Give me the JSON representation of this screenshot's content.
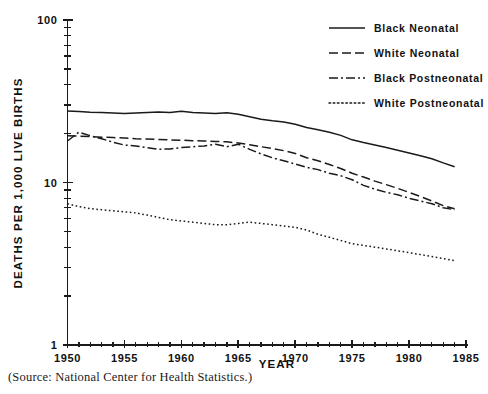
{
  "chart_data": {
    "type": "line",
    "title": "",
    "xlabel": "YEAR",
    "ylabel": "DEATHS PER 1,000 LIVE BIRTHS",
    "yscale": "log",
    "ylim": [
      1,
      100
    ],
    "xlim": [
      1949,
      1985
    ],
    "grid": false,
    "legend_position": "top-right",
    "ytick_labels": [
      "100",
      "10",
      "1"
    ],
    "ytick_values": [
      100,
      10,
      1
    ],
    "xtick_labels": [
      "1950",
      "1955",
      "1960",
      "1965",
      "1970",
      "1975",
      "1980",
      "1985"
    ],
    "xtick_values": [
      1950,
      1955,
      1960,
      1965,
      1970,
      1975,
      1980,
      1985
    ],
    "x": [
      1950,
      1951,
      1952,
      1953,
      1954,
      1955,
      1956,
      1957,
      1958,
      1959,
      1960,
      1961,
      1962,
      1963,
      1964,
      1965,
      1966,
      1967,
      1968,
      1969,
      1970,
      1971,
      1972,
      1973,
      1974,
      1975,
      1976,
      1977,
      1978,
      1979,
      1980,
      1981,
      1982,
      1983,
      1984
    ],
    "series": [
      {
        "name": "Black Neonatal",
        "style": "solid",
        "values": [
          27.5,
          27.3,
          27.1,
          27.0,
          26.8,
          26.6,
          26.8,
          27.0,
          27.2,
          27.0,
          27.4,
          27.0,
          26.8,
          26.6,
          26.9,
          26.3,
          25.4,
          24.5,
          24.0,
          23.6,
          22.8,
          21.8,
          21.1,
          20.4,
          19.5,
          18.3,
          17.6,
          17.0,
          16.4,
          15.8,
          15.2,
          14.6,
          14.0,
          13.2,
          12.5
        ]
      },
      {
        "name": "White Neonatal",
        "style": "dashed",
        "values": [
          19.4,
          19.3,
          19.2,
          19.0,
          18.9,
          18.8,
          18.6,
          18.5,
          18.4,
          18.3,
          18.2,
          18.1,
          18.0,
          17.9,
          17.8,
          17.5,
          17.1,
          16.6,
          16.2,
          15.7,
          15.1,
          14.2,
          13.6,
          12.9,
          12.2,
          11.4,
          10.8,
          10.2,
          9.7,
          9.2,
          8.7,
          8.2,
          7.7,
          7.2,
          6.9
        ]
      },
      {
        "name": "Black Postneonatal",
        "style": "dashdot",
        "values": [
          18.0,
          20.4,
          19.4,
          18.6,
          17.7,
          17.0,
          16.8,
          16.4,
          16.0,
          16.1,
          16.4,
          16.6,
          16.8,
          17.2,
          16.6,
          17.2,
          16.0,
          15.0,
          14.2,
          13.6,
          13.0,
          12.4,
          12.0,
          11.4,
          11.0,
          10.4,
          9.6,
          9.1,
          8.7,
          8.4,
          8.0,
          7.7,
          7.4,
          7.0,
          6.8
        ]
      },
      {
        "name": "White Postneonatal",
        "style": "dotted",
        "values": [
          7.4,
          7.1,
          6.9,
          6.8,
          6.7,
          6.6,
          6.5,
          6.3,
          6.1,
          5.9,
          5.8,
          5.7,
          5.6,
          5.5,
          5.5,
          5.6,
          5.7,
          5.6,
          5.5,
          5.4,
          5.3,
          5.1,
          4.8,
          4.6,
          4.4,
          4.2,
          4.1,
          4.0,
          3.9,
          3.8,
          3.7,
          3.6,
          3.5,
          3.4,
          3.3
        ]
      }
    ]
  },
  "legend": {
    "items": [
      {
        "label": "Black Neonatal",
        "style": "solid"
      },
      {
        "label": "White Neonatal",
        "style": "dashed"
      },
      {
        "label": "Black Postneonatal",
        "style": "dashdot"
      },
      {
        "label": "White Postneonatal",
        "style": "dotted"
      }
    ]
  },
  "caption": {
    "source": "(Source: National Center for Health Statistics.)"
  },
  "colors": {
    "ink": "#1a1a1a",
    "background": "#ffffff"
  }
}
